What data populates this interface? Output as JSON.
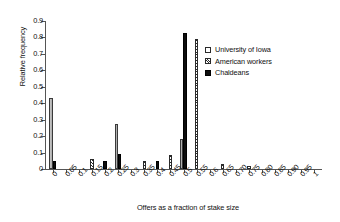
{
  "chart_data": {
    "type": "bar",
    "title": "",
    "xlabel": "Offers as a fraction of stake size",
    "ylabel": "Relative frequency",
    "ylim": [
      0,
      0.9
    ],
    "yticks": [
      "0",
      "0.1",
      "0.2",
      "0.3",
      "0.4",
      "0.5",
      "0.6",
      "0.7",
      "0.8",
      "0.9"
    ],
    "grid": false,
    "legend_position": "upper-right",
    "categories": [
      "0",
      "0.05",
      "0.1",
      "0.15",
      "0.2",
      "0.25",
      "0.3",
      "0.35",
      "0.4",
      "0.45",
      "0.5",
      "0.55",
      "0.6",
      "0.65",
      "0.70",
      "0.75",
      "0.80",
      "0.85",
      "0.90",
      "0.95",
      "1"
    ],
    "series": [
      {
        "name": "University of Iowa",
        "values": [
          0.43,
          0,
          0,
          0,
          0,
          0.275,
          0,
          0,
          0,
          0,
          0.185,
          0,
          0,
          0,
          0,
          0,
          0,
          0,
          0,
          0,
          0
        ]
      },
      {
        "name": "American workers",
        "values": [
          0,
          0,
          0,
          0.058,
          0,
          0,
          0,
          0.05,
          0,
          0.085,
          0,
          0.79,
          0,
          0.028,
          0,
          0.018,
          0,
          0,
          0,
          0,
          0
        ]
      },
      {
        "name": "Chaldeans",
        "values": [
          0.048,
          0,
          0,
          0,
          0.048,
          0.093,
          0,
          0,
          0.048,
          0,
          0.83,
          0,
          0,
          0,
          0,
          0,
          0,
          0,
          0,
          0,
          0
        ]
      }
    ]
  },
  "legend": {
    "items": [
      {
        "label": "University of Iowa",
        "swatch": "open-square",
        "color": "#ffffff"
      },
      {
        "label": "American workers",
        "swatch": "hatched-square",
        "color": "#2e2e2e"
      },
      {
        "label": "Chaldeans",
        "swatch": "filled-square",
        "color": "#0d0d0d"
      }
    ]
  }
}
